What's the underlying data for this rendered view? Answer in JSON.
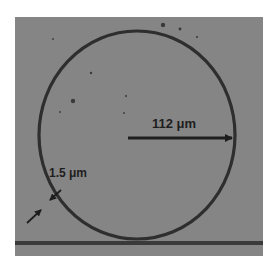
{
  "figure": {
    "panel_label_fragment": ")",
    "annotations": {
      "radius_label": "112 μm",
      "width_label": "1.5 μm"
    },
    "colors": {
      "background": "#858585",
      "ring": "#2e2e2e",
      "arrow": "#1e1e1e",
      "page": "#ffffff"
    }
  }
}
